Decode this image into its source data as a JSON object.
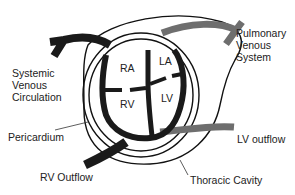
{
  "diagram": {
    "labels": {
      "systemic": [
        "Systemic",
        "Venous",
        "Circulation"
      ],
      "pulmonary": [
        "Pulmonary",
        "Venous",
        "System"
      ],
      "pericardium": "Pericardium",
      "rv_outflow": "RV Outflow",
      "lv_outflow": "LV outflow",
      "thoracic": "Thoracic Cavity"
    },
    "chambers": {
      "ra": "RA",
      "la": "LA",
      "rv": "RV",
      "lv": "LV"
    },
    "colors": {
      "right_side": "#1a1a1a",
      "left_side": "#6e6e6e",
      "outline": "#111111"
    }
  }
}
